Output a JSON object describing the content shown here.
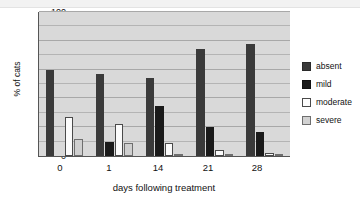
{
  "chart_data": {
    "type": "bar",
    "title": "",
    "subtitle": "",
    "xlabel": "days following treatment",
    "ylabel": "% of cats",
    "categories": [
      "0",
      "1",
      "14",
      "21",
      "28"
    ],
    "series": [
      {
        "name": "absent",
        "color": "#3a3a3a",
        "values": [
          60,
          57,
          54,
          74,
          78
        ]
      },
      {
        "name": "mild",
        "color": "#1a1a1a",
        "values": [
          0,
          10,
          35,
          20,
          17
        ]
      },
      {
        "name": "moderate",
        "color": "#fbfbfb",
        "values": [
          27,
          22,
          9,
          4,
          2
        ]
      },
      {
        "name": "severe",
        "color": "#cfcfcf",
        "values": [
          12,
          9,
          1,
          1,
          1
        ]
      }
    ],
    "ylim": [
      0,
      100
    ],
    "ytick_labels": [
      "0",
      "20",
      "40",
      "60",
      "80",
      "100"
    ],
    "ytick_values": [
      0,
      20,
      40,
      60,
      80,
      100
    ],
    "gridlines": true,
    "gridline_interval": 10,
    "legend_position": "right",
    "plot_background": "#d9d9d9"
  },
  "axes": {
    "y_label": "% of cats",
    "x_label": "days following treatment",
    "y_ticks": [
      "100",
      "80",
      "60",
      "40",
      "20",
      "0"
    ],
    "x_ticks": [
      "0",
      "1",
      "14",
      "21",
      "28"
    ]
  },
  "legend": {
    "items": [
      {
        "label": "absent"
      },
      {
        "label": "mild"
      },
      {
        "label": "moderate"
      },
      {
        "label": "severe"
      }
    ]
  }
}
